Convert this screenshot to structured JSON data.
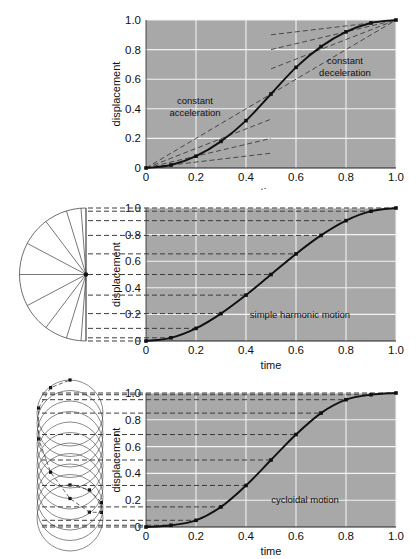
{
  "figures": [
    {
      "id": "constant-acceleration-deceleration",
      "xlabel": "time",
      "ylabel": "displacement",
      "annotations": [
        {
          "name": "constant-acceleration-label",
          "text": "constant\nacceleration",
          "line1": "constant",
          "line2": "acceleration"
        },
        {
          "name": "constant-deceleration-label",
          "text": "constant\ndeceleration",
          "line1": "constant",
          "line2": "deceleration"
        }
      ],
      "inplot_label": ""
    },
    {
      "id": "simple-harmonic-motion",
      "xlabel": "time",
      "ylabel": "displacement",
      "inplot_label": "simple harmonic motion",
      "construction": "semicircle-radial-fan"
    },
    {
      "id": "cycloidal-motion",
      "xlabel": "time",
      "ylabel": "displacement",
      "inplot_label": "cycloidal motion",
      "construction": "stacked-rolling-circles"
    }
  ],
  "axes": {
    "x_ticks": [
      "0",
      "0.2",
      "0.4",
      "0.6",
      "0.8",
      "1.0"
    ],
    "x_values": [
      0,
      0.2,
      0.4,
      0.6,
      0.8,
      1.0
    ],
    "y_ticks": [
      "0",
      "0.2",
      "0.4",
      "0.6",
      "0.8",
      "1.0"
    ],
    "y_values": [
      0,
      0.2,
      0.4,
      0.6,
      0.8,
      1.0
    ],
    "xlim": [
      0,
      1
    ],
    "ylim": [
      0,
      1
    ]
  },
  "colors": {
    "plot_background": "#a8a8a8",
    "gridline": "#f2f2f2",
    "curve": "#111111",
    "dashed": "#3c3c3c",
    "construction": "#4a4a4a",
    "text": "#111111",
    "page_background": "#ffffff"
  },
  "chart_data": [
    {
      "type": "line",
      "title": "constant acceleration / constant deceleration",
      "xlabel": "time",
      "ylabel": "displacement",
      "xlim": [
        0,
        1
      ],
      "ylim": [
        0,
        1
      ],
      "grid": true,
      "legend": "none",
      "annotations": [
        "constant acceleration",
        "constant deceleration"
      ],
      "series": [
        {
          "name": "parabolic ease-in-out (main curve)",
          "marker": "square",
          "x": [
            0.0,
            0.1,
            0.2,
            0.3,
            0.4,
            0.5,
            0.6,
            0.7,
            0.8,
            0.9,
            1.0
          ],
          "values": [
            0.0,
            0.02,
            0.08,
            0.18,
            0.32,
            0.5,
            0.68,
            0.82,
            0.92,
            0.98,
            1.0
          ]
        },
        {
          "name": "acceleration fan line 1 (shallow)",
          "style": "dashed",
          "x": [
            0.0,
            0.5
          ],
          "values": [
            0.0,
            0.1
          ]
        },
        {
          "name": "acceleration fan line 2",
          "style": "dashed",
          "x": [
            0.0,
            0.5
          ],
          "values": [
            0.0,
            0.2
          ]
        },
        {
          "name": "acceleration fan line 3",
          "style": "dashed",
          "x": [
            0.0,
            0.5
          ],
          "values": [
            0.0,
            0.33
          ]
        },
        {
          "name": "acceleration fan line 4 (steep)",
          "style": "dashed",
          "x": [
            0.0,
            0.5
          ],
          "values": [
            0.0,
            0.5
          ]
        },
        {
          "name": "deceleration fan line 1 (steep)",
          "style": "dashed",
          "x": [
            0.5,
            1.0
          ],
          "values": [
            0.5,
            1.0
          ]
        },
        {
          "name": "deceleration fan line 2",
          "style": "dashed",
          "x": [
            0.5,
            1.0
          ],
          "values": [
            0.67,
            1.0
          ]
        },
        {
          "name": "deceleration fan line 3",
          "style": "dashed",
          "x": [
            0.5,
            1.0
          ],
          "values": [
            0.8,
            1.0
          ]
        },
        {
          "name": "deceleration fan line 4 (shallow)",
          "style": "dashed",
          "x": [
            0.5,
            1.0
          ],
          "values": [
            0.9,
            1.0
          ]
        }
      ]
    },
    {
      "type": "line",
      "title": "simple harmonic motion",
      "xlabel": "time",
      "ylabel": "displacement",
      "xlim": [
        0,
        1
      ],
      "ylim": [
        0,
        1
      ],
      "grid": true,
      "legend": "none",
      "series": [
        {
          "name": "sinusoidal ease (main curve)",
          "marker": "square",
          "x": [
            0.0,
            0.1,
            0.2,
            0.3,
            0.4,
            0.5,
            0.6,
            0.7,
            0.8,
            0.9,
            1.0
          ],
          "values": [
            0.0,
            0.024,
            0.095,
            0.206,
            0.345,
            0.5,
            0.655,
            0.794,
            0.905,
            0.976,
            1.0
          ]
        }
      ],
      "tie_lines": {
        "style": "dashed",
        "y_values": [
          0.0,
          0.024,
          0.095,
          0.206,
          0.345,
          0.5,
          0.655,
          0.794,
          0.905,
          0.976,
          1.0
        ]
      }
    },
    {
      "type": "line",
      "title": "cycloidal motion",
      "xlabel": "time",
      "ylabel": "displacement",
      "xlim": [
        0,
        1
      ],
      "ylim": [
        0,
        1
      ],
      "grid": true,
      "legend": "none",
      "series": [
        {
          "name": "cycloidal ease (main curve)",
          "marker": "square",
          "x": [
            0.0,
            0.1,
            0.2,
            0.3,
            0.4,
            0.5,
            0.6,
            0.7,
            0.8,
            0.9,
            1.0
          ],
          "values": [
            0.0,
            0.013,
            0.05,
            0.15,
            0.31,
            0.5,
            0.69,
            0.85,
            0.95,
            0.987,
            1.0
          ]
        }
      ],
      "tie_lines": {
        "style": "dashed",
        "y_values": [
          0.0,
          0.013,
          0.05,
          0.15,
          0.31,
          0.5,
          0.69,
          0.85,
          0.95,
          0.987,
          1.0
        ]
      }
    }
  ]
}
